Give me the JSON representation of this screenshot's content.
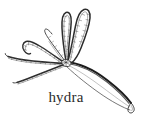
{
  "figure": {
    "kind": "scientific-line-illustration",
    "subject": "hydra",
    "caption": "hydra",
    "caption_font_style": "serif",
    "background_color": "#ffffff",
    "ink_color": "#2b2b2b",
    "canvas": {
      "width": 146,
      "height": 123
    }
  },
  "anatomy": {
    "hypostome": {
      "label": "hypostome",
      "center_x": 66,
      "center_y": 62
    },
    "body": {
      "label": "body-column",
      "description": "elongated tapering tube extending to lower right ending in a rounded basal foot",
      "foot_x": 131,
      "foot_y": 110
    },
    "tentacles": [
      {
        "name": "tentacle-upper-left-loop",
        "direction": "up-left"
      },
      {
        "name": "tentacle-upper-right-loop",
        "direction": "up-right"
      },
      {
        "name": "tentacle-upper-center",
        "direction": "up"
      },
      {
        "name": "tentacle-left-hook",
        "direction": "left-curled"
      },
      {
        "name": "tentacle-left-straight",
        "direction": "left"
      },
      {
        "name": "tentacle-lower-left",
        "direction": "lower-left"
      }
    ],
    "tentacle_texture": "beaded-segmented"
  }
}
